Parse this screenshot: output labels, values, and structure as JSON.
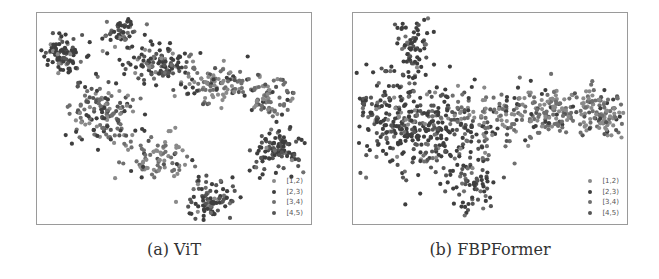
{
  "chart_data": [
    {
      "type": "scatter",
      "title": "(a) ViT",
      "caption": "(a) ViT",
      "xlabel": "",
      "ylabel": "",
      "grid": false,
      "axes_ticks": false,
      "legend_position": "lower right",
      "legend": [
        "[1,2)",
        "[2,3)",
        "[3,4)",
        "[4,5)"
      ],
      "series_colors": [
        "#8a8a8a",
        "#3e3e3e",
        "#6f6f6f",
        "#555555"
      ],
      "description": "t-SNE embedding with well-separated clusters: top-left blob, small top blob, arc from top-center to right, right blob, left-middle blob, diagonal band to a bottom-center blob",
      "clusters": [
        {
          "cx": 25,
          "cy": 42,
          "sx": 10,
          "sy": 9,
          "n": 90,
          "mix": [
            0.1,
            0.55,
            0.15,
            0.2
          ]
        },
        {
          "cx": 84,
          "cy": 20,
          "sx": 9,
          "sy": 8,
          "n": 55,
          "mix": [
            0.1,
            0.55,
            0.15,
            0.2
          ]
        },
        {
          "cx": 120,
          "cy": 52,
          "sx": 16,
          "sy": 9,
          "n": 110,
          "mix": [
            0.1,
            0.5,
            0.15,
            0.25
          ]
        },
        {
          "cx": 175,
          "cy": 70,
          "sx": 20,
          "sy": 10,
          "n": 100,
          "mix": [
            0.35,
            0.15,
            0.4,
            0.1
          ]
        },
        {
          "cx": 230,
          "cy": 85,
          "sx": 16,
          "sy": 10,
          "n": 80,
          "mix": [
            0.35,
            0.15,
            0.4,
            0.1
          ]
        },
        {
          "cx": 240,
          "cy": 137,
          "sx": 13,
          "sy": 11,
          "n": 100,
          "mix": [
            0.05,
            0.55,
            0.1,
            0.3
          ]
        },
        {
          "cx": 65,
          "cy": 100,
          "sx": 18,
          "sy": 16,
          "n": 150,
          "mix": [
            0.2,
            0.3,
            0.3,
            0.2
          ]
        },
        {
          "cx": 120,
          "cy": 145,
          "sx": 16,
          "sy": 12,
          "n": 80,
          "mix": [
            0.45,
            0.1,
            0.4,
            0.05
          ]
        },
        {
          "cx": 175,
          "cy": 185,
          "sx": 12,
          "sy": 10,
          "n": 90,
          "mix": [
            0.05,
            0.55,
            0.1,
            0.3
          ]
        }
      ]
    },
    {
      "type": "scatter",
      "title": "(b) FBPFormer",
      "caption": "(b) FBPFormer",
      "xlabel": "",
      "ylabel": "",
      "grid": false,
      "axes_ticks": false,
      "legend_position": "lower right",
      "legend": [
        "[1,2)",
        "[2,3)",
        "[3,4)",
        "[4,5)"
      ],
      "series_colors": [
        "#8a8a8a",
        "#3e3e3e",
        "#6f6f6f",
        "#555555"
      ],
      "description": "t-SNE embedding forming a continuous manifold: upward spike at top-left, dense dark left mass, lighter band extending right, small lobe hanging down at center",
      "clusters": [
        {
          "cx": 60,
          "cy": 35,
          "sx": 9,
          "sy": 16,
          "n": 80,
          "mix": [
            0.05,
            0.6,
            0.1,
            0.25
          ]
        },
        {
          "cx": 40,
          "cy": 105,
          "sx": 22,
          "sy": 22,
          "n": 200,
          "mix": [
            0.1,
            0.55,
            0.1,
            0.25
          ]
        },
        {
          "cx": 85,
          "cy": 120,
          "sx": 22,
          "sy": 25,
          "n": 180,
          "mix": [
            0.1,
            0.5,
            0.15,
            0.25
          ]
        },
        {
          "cx": 140,
          "cy": 105,
          "sx": 22,
          "sy": 16,
          "n": 110,
          "mix": [
            0.3,
            0.2,
            0.35,
            0.15
          ]
        },
        {
          "cx": 200,
          "cy": 98,
          "sx": 22,
          "sy": 14,
          "n": 150,
          "mix": [
            0.4,
            0.1,
            0.42,
            0.08
          ]
        },
        {
          "cx": 250,
          "cy": 100,
          "sx": 14,
          "sy": 12,
          "n": 100,
          "mix": [
            0.4,
            0.1,
            0.42,
            0.08
          ]
        },
        {
          "cx": 120,
          "cy": 170,
          "sx": 11,
          "sy": 13,
          "n": 60,
          "mix": [
            0.1,
            0.5,
            0.15,
            0.25
          ]
        }
      ]
    }
  ]
}
